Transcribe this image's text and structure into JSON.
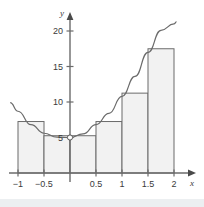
{
  "figure": {
    "name": "riemann-sum-figure",
    "background": "#ffffff",
    "footer_band_color": "#eceff1"
  },
  "chart_data": {
    "type": "bar",
    "title": "",
    "subtitle": "",
    "xlabel": "x",
    "ylabel": "y",
    "xlim": [
      -1.15,
      2.15
    ],
    "ylim": [
      0,
      21.5
    ],
    "grid": false,
    "legend": null,
    "x_ticks": [
      -1,
      -0.5,
      0.5,
      1,
      1.5,
      2
    ],
    "x_tick_labels": [
      "−1",
      "−0.5",
      "0.5",
      "1",
      "1.5",
      "2"
    ],
    "y_ticks": [
      5,
      10,
      15,
      20
    ],
    "y_tick_labels": [
      "5",
      "10",
      "15",
      "20"
    ],
    "bar_fill": "#f2f2f2",
    "bar_edge": "#6b6b6b",
    "curve_color": "#6b6b6b",
    "axis_color": "#6b6b6b",
    "bar_width": 0.5,
    "categories": [
      "-1",
      "-0.5",
      "0",
      "0.5",
      "1",
      "1.5"
    ],
    "bar_left_edges": [
      -1,
      -0.5,
      0,
      0.5,
      1,
      1.5
    ],
    "values": [
      7.25,
      5.25,
      5.25,
      7.25,
      11.25,
      17.5
    ],
    "curve": {
      "name": "f(x)",
      "x_start": -1.15,
      "x_end": 2.05,
      "points_x": [
        -1.15,
        -1.0,
        -0.75,
        -0.5,
        -0.25,
        0.0,
        0.25,
        0.5,
        0.75,
        1.0,
        1.25,
        1.5,
        1.75,
        2.0,
        2.05
      ],
      "points_y": [
        9.9,
        8.7,
        6.8,
        5.6,
        5.05,
        5.0,
        5.5,
        6.8,
        8.4,
        10.8,
        13.6,
        17.0,
        20.1,
        21.0,
        21.3
      ]
    },
    "markers": [
      {
        "name": "vertex-point",
        "x": 0.0,
        "y": 5.0
      }
    ]
  }
}
